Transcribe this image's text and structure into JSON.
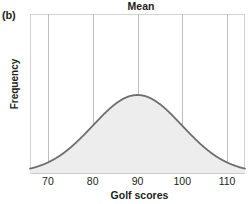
{
  "figure": {
    "panel_label": "(b)",
    "title": "Mean",
    "xlabel": "Golf scores",
    "ylabel": "Frequency"
  },
  "colors": {
    "curve_stroke": "#6d6e70",
    "curve_fill": "#ededed",
    "gridline": "#bcbec0",
    "axis": "#d1d3d4",
    "text": "#231f20",
    "background": "#ffffff"
  },
  "chart_data": {
    "type": "line",
    "title": "Mean",
    "xlabel": "Golf scores",
    "ylabel": "Frequency",
    "xlim": [
      66,
      114
    ],
    "ylim": [
      0,
      1.05
    ],
    "xticks": [
      70,
      80,
      90,
      100,
      110
    ],
    "xticklabels": [
      "70",
      "80",
      "90",
      "100",
      "110"
    ],
    "yticks": [],
    "yticklabels": [],
    "grid": "vertical",
    "legend": "none",
    "annotations": [
      {
        "text": "Mean",
        "x": 90,
        "note": "title placed above mean gridline"
      },
      {
        "text": "(b)",
        "note": "panel label, top-left outside axes"
      }
    ],
    "distribution": {
      "kind": "normal",
      "mean": 90,
      "sigma": 10,
      "peak_relative_height": 1.0,
      "fill_under_curve": true
    },
    "x": [
      66,
      68,
      70,
      72,
      74,
      76,
      78,
      80,
      82,
      84,
      86,
      88,
      90,
      92,
      94,
      96,
      98,
      100,
      102,
      104,
      106,
      108,
      110,
      112,
      114
    ],
    "y": [
      0.007,
      0.015,
      0.03,
      0.055,
      0.095,
      0.15,
      0.224,
      0.325,
      0.444,
      0.562,
      0.726,
      0.867,
      1.0,
      0.96,
      0.852,
      0.717,
      0.551,
      0.41,
      0.278,
      0.18,
      0.11,
      0.064,
      0.03,
      0.015,
      0.007
    ],
    "series": [
      {
        "name": "Golf score frequency distribution",
        "values": [
          0.007,
          0.015,
          0.03,
          0.055,
          0.095,
          0.15,
          0.224,
          0.325,
          0.444,
          0.562,
          0.726,
          0.867,
          1.0,
          0.96,
          0.852,
          0.717,
          0.551,
          0.41,
          0.278,
          0.18,
          0.11,
          0.064,
          0.03,
          0.015,
          0.007
        ]
      }
    ]
  }
}
